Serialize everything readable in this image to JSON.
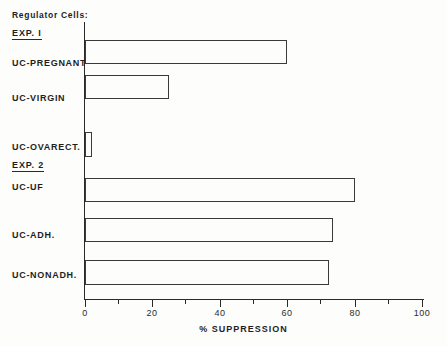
{
  "header": {
    "label": "Regulator Cells:"
  },
  "axis": {
    "x_title": "% SUPPRESSION",
    "tick_labels": [
      "0",
      "20",
      "40",
      "60",
      "80",
      "100"
    ],
    "tick_values": [
      0,
      20,
      40,
      60,
      80,
      100
    ],
    "minor_tick_values": [
      10,
      30,
      50,
      70,
      90
    ]
  },
  "groups": [
    {
      "label": "EXP. I"
    },
    {
      "label": "EXP. 2"
    }
  ],
  "chart_data": {
    "type": "bar",
    "orientation": "horizontal",
    "title": "",
    "xlabel": "% SUPPRESSION",
    "ylabel": "Regulator Cells:",
    "xlim": [
      0,
      100
    ],
    "grid": false,
    "legend": "none",
    "categories": [
      "UC-PREGNANT",
      "UC-VIRGIN",
      "UC-OVARECT.",
      "UC-UF",
      "UC-ADH.",
      "UC-NONADH."
    ],
    "values": [
      60,
      25,
      2,
      80,
      73.5,
      72.5
    ],
    "groups": [
      "EXP. I",
      "EXP. I",
      "EXP. I",
      "EXP. 2",
      "EXP. 2",
      "EXP. 2"
    ],
    "bars": [
      {
        "label": "UC-PREGNANT",
        "value": 60,
        "group": "EXP. I",
        "top": 40,
        "height": 24
      },
      {
        "label": "UC-VIRGIN",
        "value": 25,
        "group": "EXP. I",
        "top": 75,
        "height": 24
      },
      {
        "label": "UC-OVARECT.",
        "value": 2,
        "group": "EXP. I",
        "top": 132,
        "height": 25
      },
      {
        "label": "UC-UF",
        "value": 80,
        "group": "EXP. 2",
        "top": 178,
        "height": 24
      },
      {
        "label": "UC-ADH.",
        "value": 73.5,
        "group": "EXP. 2",
        "top": 218,
        "height": 24
      },
      {
        "label": "UC-NONADH.",
        "value": 72.5,
        "group": "EXP. 2",
        "top": 260,
        "height": 25
      }
    ]
  },
  "style": {
    "line_color": "#2a2a2a",
    "bar_edge_color": "#3a3a3a",
    "bar_fill_color": "transparent",
    "background": "#fdfdfc",
    "text_color": "#1f1f1f"
  }
}
